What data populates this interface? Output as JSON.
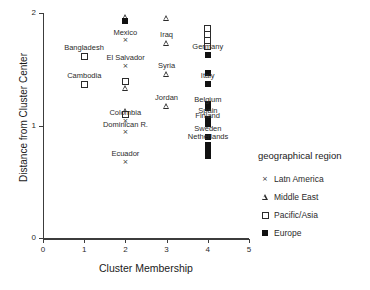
{
  "chart_data": {
    "type": "scatter",
    "title": "",
    "xlabel": "Cluster Membership",
    "ylabel": "Distance from Cluster Center",
    "xlim": [
      0,
      5
    ],
    "ylim": [
      0,
      2
    ],
    "xticks": [
      "0",
      "1",
      "2",
      "3",
      "4",
      "5"
    ],
    "yticks": [
      "0",
      "1",
      "2"
    ],
    "grid": false,
    "legend_position": "right",
    "legend_title": "geographical region",
    "series": [
      {
        "name": "Latn America",
        "marker": "cross"
      },
      {
        "name": "Middle East",
        "marker": "triangle"
      },
      {
        "name": "Pacific/Asia",
        "marker": "square-open"
      },
      {
        "name": "Europe",
        "marker": "square-filled"
      }
    ],
    "points": [
      {
        "x": 2,
        "y": 1.965,
        "group": "Middle East",
        "marker": "triangle",
        "label": ""
      },
      {
        "x": 2,
        "y": 1.93,
        "group": "Europe",
        "marker": "square-filled",
        "label": ""
      },
      {
        "x": 2,
        "y": 1.755,
        "group": "Latn America",
        "marker": "cross",
        "label": "Mexico",
        "label_pos": "above"
      },
      {
        "x": 2,
        "y": 1.525,
        "group": "Latn America",
        "marker": "cross",
        "label": "El Salvador",
        "label_pos": "above"
      },
      {
        "x": 2,
        "y": 1.395,
        "group": "Pacific/Asia",
        "marker": "square-open",
        "label": ""
      },
      {
        "x": 2,
        "y": 1.335,
        "group": "Middle East",
        "marker": "triangle",
        "label": ""
      },
      {
        "x": 2,
        "y": 1.13,
        "group": "Middle East",
        "marker": "triangle",
        "label": ""
      },
      {
        "x": 2,
        "y": 1.1,
        "group": "Pacific/Asia",
        "marker": "square-open",
        "label": ""
      },
      {
        "x": 2,
        "y": 1.04,
        "group": "Latn America",
        "marker": "cross",
        "label": "Colombia",
        "label_pos": "above"
      },
      {
        "x": 2,
        "y": 0.935,
        "group": "Latn America",
        "marker": "cross",
        "label": "Dominican R.",
        "label_pos": "above"
      },
      {
        "x": 2,
        "y": 0.675,
        "group": "Latn America",
        "marker": "cross",
        "label": "Ecuador",
        "label_pos": "above"
      },
      {
        "x": 1,
        "y": 1.615,
        "group": "Pacific/Asia",
        "marker": "square-open",
        "label": "Bangladesh",
        "label_pos": "above"
      },
      {
        "x": 1,
        "y": 1.365,
        "group": "Pacific/Asia",
        "marker": "square-open",
        "label": "Cambodia",
        "label_pos": "above"
      },
      {
        "x": 3,
        "y": 1.955,
        "group": "Middle East",
        "marker": "triangle",
        "label": ""
      },
      {
        "x": 3,
        "y": 1.735,
        "group": "Middle East",
        "marker": "triangle",
        "label": "Iraq",
        "label_pos": "above"
      },
      {
        "x": 3,
        "y": 1.455,
        "group": "Middle East",
        "marker": "triangle",
        "label": "Syria",
        "label_pos": "above"
      },
      {
        "x": 3,
        "y": 1.17,
        "group": "Middle East",
        "marker": "triangle",
        "label": "Jordan",
        "label_pos": "above"
      },
      {
        "x": 4,
        "y": 1.86,
        "group": "Pacific/Asia",
        "marker": "square-open",
        "label": ""
      },
      {
        "x": 4,
        "y": 1.805,
        "group": "Pacific/Asia",
        "marker": "square-open",
        "label": ""
      },
      {
        "x": 4,
        "y": 1.755,
        "group": "Pacific/Asia",
        "marker": "square-open",
        "label": ""
      },
      {
        "x": 4,
        "y": 1.705,
        "group": "Pacific/Asia",
        "marker": "square-open",
        "label": ""
      },
      {
        "x": 4,
        "y": 1.625,
        "group": "Europe",
        "marker": "square-filled",
        "label": "Germany",
        "label_pos": "above"
      },
      {
        "x": 4,
        "y": 1.465,
        "group": "Europe",
        "marker": "square-filled",
        "label": ""
      },
      {
        "x": 4,
        "y": 1.37,
        "group": "Europe",
        "marker": "square-filled",
        "label": "Italy",
        "label_pos": "above"
      },
      {
        "x": 4,
        "y": 1.195,
        "group": "Europe",
        "marker": "square-filled",
        "label": ""
      },
      {
        "x": 4,
        "y": 1.155,
        "group": "Europe",
        "marker": "square-filled",
        "label": "Belgium",
        "label_pos": "above"
      },
      {
        "x": 4,
        "y": 1.06,
        "group": "Europe",
        "marker": "square-filled",
        "label": "Spain",
        "label_pos": "above"
      },
      {
        "x": 4,
        "y": 1.01,
        "group": "Europe",
        "marker": "square-filled",
        "label": "Finland",
        "label_pos": "above"
      },
      {
        "x": 4,
        "y": 0.895,
        "group": "Europe",
        "marker": "square-filled",
        "label": "Sweden",
        "label_pos": "above"
      },
      {
        "x": 4,
        "y": 0.83,
        "group": "Europe",
        "marker": "square-filled",
        "label": "Netherlands",
        "label_pos": "above"
      },
      {
        "x": 4,
        "y": 0.775,
        "group": "Europe",
        "marker": "square-filled",
        "label": ""
      },
      {
        "x": 4,
        "y": 0.73,
        "group": "Europe",
        "marker": "square-filled",
        "label": ""
      }
    ]
  },
  "axes": {
    "x_title": "Cluster Membership",
    "y_title": "Distance from Cluster Center",
    "x_ticks": [
      "0",
      "1",
      "2",
      "3",
      "4",
      "5"
    ],
    "y_ticks": [
      "0",
      "1",
      "2"
    ]
  },
  "legend": {
    "title": "geographical region",
    "items": [
      {
        "label": "Latn America"
      },
      {
        "label": "Middle East"
      },
      {
        "label": "Pacific/Asia"
      },
      {
        "label": "Europe"
      }
    ]
  },
  "colors": {
    "axis": "#3c3c3c",
    "marker": "#2b2b2b",
    "text": "#1a1a1a",
    "background": "#ffffff"
  }
}
